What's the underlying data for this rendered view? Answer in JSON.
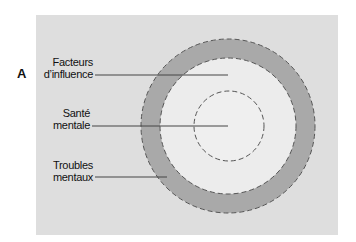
{
  "panel_letter": "A",
  "labels": {
    "factors": [
      "Facteurs",
      "d’influence"
    ],
    "health": [
      "Santé",
      "mentale"
    ],
    "disorders": [
      "Troubles",
      "mentaux"
    ]
  },
  "colors": {
    "background": "#dedede",
    "ring": "#a9a9a9",
    "inner_fill": "#ececec",
    "dash": "#555555",
    "leader": "#444444"
  }
}
